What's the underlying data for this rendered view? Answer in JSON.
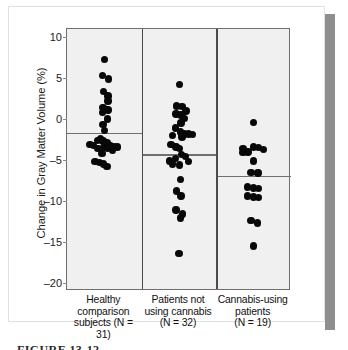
{
  "figure": {
    "caption_partial": "FIGURE 13-12"
  },
  "chart_data": {
    "type": "scatter",
    "title": "",
    "xlabel": "",
    "ylabel": "Change in Gray Matter Volume (%)",
    "ylim": [
      -21,
      11
    ],
    "yticks": [
      10,
      5,
      0,
      -5,
      -10,
      -15,
      -20
    ],
    "ytick_labels": [
      "10",
      "5",
      "0",
      "–5",
      "–10",
      "–15",
      "–20"
    ],
    "grid": false,
    "legend": "none",
    "groups": [
      {
        "id": "healthy-comparison-subjects",
        "label_lines": [
          "Healthy",
          "comparison",
          "subjects (N = 31)"
        ],
        "n": 31,
        "mean": -1.7,
        "values": [
          7.3,
          5.3,
          4.9,
          3.4,
          2.8,
          2.2,
          1.4,
          1.1,
          0.8,
          0.0,
          -0.7,
          -1.4,
          -2.4,
          -2.6,
          -2.7,
          -2.9,
          -3.1,
          -3.2,
          -3.3,
          -3.4,
          -3.4,
          -3.5,
          -3.5,
          -3.6,
          -3.6,
          -3.8,
          -4.2,
          -5.2,
          -5.3,
          -5.5,
          -5.8
        ],
        "x_offsets": [
          0.0,
          -0.05,
          0.14,
          -0.02,
          0.12,
          0.12,
          -0.04,
          0.12,
          -0.06,
          0.1,
          -0.04,
          0.0,
          -0.12,
          -0.22,
          -0.04,
          0.08,
          -0.46,
          -0.34,
          0.2,
          0.32,
          0.42,
          -0.02,
          0.12,
          -0.2,
          0.1,
          0.26,
          -0.08,
          -0.3,
          -0.16,
          -0.02,
          0.08
        ]
      },
      {
        "id": "patients-not-using-cannabis",
        "label_lines": [
          "Patients not",
          "using cannabis",
          "(N = 32)"
        ],
        "n": 32,
        "mean": -4.3,
        "values": [
          4.2,
          1.6,
          1.5,
          1.0,
          0.6,
          0.5,
          0.1,
          -0.5,
          -1.1,
          -1.6,
          -1.8,
          -1.8,
          -1.9,
          -2.0,
          -2.2,
          -3.1,
          -3.4,
          -3.6,
          -4.3,
          -4.6,
          -4.8,
          -5.1,
          -5.2,
          -5.5,
          -5.6,
          -7.4,
          -8.8,
          -9.4,
          -11.1,
          -11.6,
          -12.1,
          -16.4
        ],
        "x_offsets": [
          0.02,
          -0.08,
          0.1,
          0.22,
          -0.1,
          0.06,
          0.18,
          0.06,
          -0.12,
          0.04,
          0.16,
          0.3,
          0.44,
          -0.2,
          0.1,
          -0.26,
          -0.1,
          0.02,
          0.08,
          0.2,
          -0.12,
          -0.3,
          0.3,
          -0.2,
          0.02,
          0.04,
          -0.08,
          0.06,
          -0.1,
          0.12,
          0.04,
          0.0
        ]
      },
      {
        "id": "cannabis-using-patients",
        "label_lines": [
          "Cannabis-using",
          "patients",
          "(N = 19)"
        ],
        "n": 19,
        "mean": -6.9,
        "values": [
          -0.4,
          -3.4,
          -3.5,
          -3.7,
          -4.0,
          -4.1,
          -5.1,
          -6.5,
          -6.6,
          -8.3,
          -8.4,
          -8.5,
          -9.4,
          -9.5,
          -9.6,
          -12.4,
          -12.7,
          -15.5,
          -3.6
        ],
        "x_offsets": [
          0.0,
          0.0,
          0.16,
          0.32,
          -0.18,
          -0.34,
          0.0,
          -0.08,
          0.14,
          -0.2,
          0.0,
          0.16,
          -0.2,
          0.0,
          0.16,
          -0.08,
          0.12,
          0.0,
          -0.34
        ]
      }
    ]
  }
}
